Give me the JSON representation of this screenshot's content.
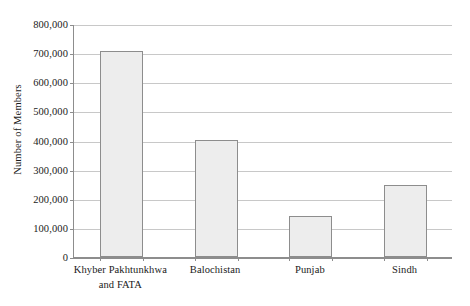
{
  "chart_data": {
    "type": "bar",
    "title": "",
    "xlabel": "",
    "ylabel": "Number of Members",
    "categories": [
      "Khyber Pakhtunkhwa and FATA",
      "Balochistan",
      "Punjab",
      "Sindh"
    ],
    "category_lines": [
      [
        "Khyber Pakhtunkhwa",
        "and FATA"
      ],
      [
        "Balochistan"
      ],
      [
        "Punjab"
      ],
      [
        "Sindh"
      ]
    ],
    "values": [
      708000,
      403000,
      140000,
      247000
    ],
    "ylim": [
      0,
      800000
    ],
    "ytick_values": [
      0,
      100000,
      200000,
      300000,
      400000,
      500000,
      600000,
      700000,
      800000
    ],
    "ytick_labels": [
      "0",
      "100,000",
      "200,000",
      "300,000",
      "400,000",
      "500,000",
      "600,000",
      "700,000",
      "800,000"
    ],
    "grid": "horizontal",
    "legend": "none",
    "bar_fill_color": "#ededed",
    "bar_border_color": "#8d8d8d",
    "gridline_color": "#c8c8c8",
    "axis_color": "#8d8d8d",
    "background_color": "#ffffff"
  }
}
